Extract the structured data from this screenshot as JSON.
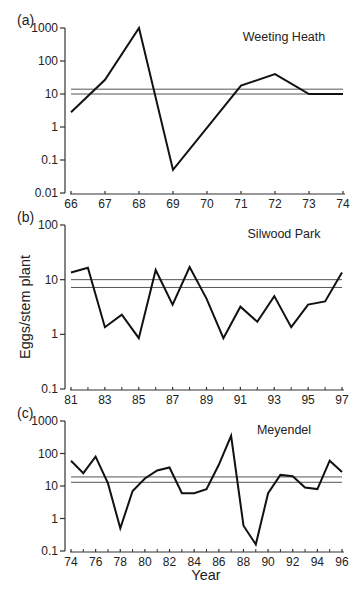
{
  "chart_data": [
    {
      "type": "line",
      "panel_label": "(a)",
      "title": "Weeting Heath",
      "xlabel": "",
      "ylabel": "Eggs/stem plant",
      "yscale": "log",
      "ylim": [
        0.01,
        1000
      ],
      "yticks": [
        "0.01",
        "0.1",
        "1",
        "10",
        "100",
        "1000"
      ],
      "ytick_values": [
        0.01,
        0.1,
        1,
        10,
        100,
        1000
      ],
      "xlim": [
        66,
        74
      ],
      "xticks": [
        "66",
        "67",
        "68",
        "69",
        "70",
        "71",
        "72",
        "73",
        "74"
      ],
      "xtick_values": [
        66,
        67,
        68,
        69,
        70,
        71,
        72,
        73,
        74
      ],
      "minor_xticks": [],
      "x": [
        66,
        67,
        68,
        69,
        71,
        72,
        73,
        74
      ],
      "values": [
        2.8,
        27,
        1000,
        0.05,
        18,
        40,
        10,
        10
      ],
      "reference_lines": [
        14,
        10
      ],
      "grid": false,
      "layout": {
        "top": 28,
        "bottom": 193,
        "left": 71,
        "right": 343,
        "axis_x": 65
      }
    },
    {
      "type": "line",
      "panel_label": "(b)",
      "title": "Silwood Park",
      "xlabel": "",
      "ylabel": "Eggs/stem plant",
      "yscale": "log",
      "ylim": [
        0.1,
        100
      ],
      "yticks": [
        "0.1",
        "1",
        "10",
        "100"
      ],
      "ytick_values": [
        0.1,
        1,
        10,
        100
      ],
      "xlim": [
        81,
        97
      ],
      "xticks": [
        "81",
        "83",
        "85",
        "87",
        "89",
        "91",
        "93",
        "95",
        "97"
      ],
      "xtick_values": [
        81,
        83,
        85,
        87,
        89,
        91,
        93,
        95,
        97
      ],
      "minor_xticks": [
        82,
        84,
        86,
        88,
        90,
        92,
        94,
        96
      ],
      "x": [
        81,
        82,
        83,
        84,
        85,
        86,
        87,
        88,
        89,
        90,
        91,
        92,
        93,
        94,
        95,
        96,
        97
      ],
      "values": [
        13.5,
        16.5,
        1.35,
        2.3,
        0.85,
        15,
        3.5,
        17,
        4.5,
        0.85,
        3.2,
        1.7,
        5,
        1.35,
        3.5,
        4,
        13.5
      ],
      "reference_lines": [
        10,
        7.2
      ],
      "grid": false,
      "layout": {
        "top": 225,
        "bottom": 389,
        "left": 71,
        "right": 342,
        "axis_x": 65
      }
    },
    {
      "type": "line",
      "panel_label": "(c)",
      "title": "Meyendel",
      "xlabel": "Year",
      "ylabel": "Eggs/stem plant",
      "yscale": "log",
      "ylim": [
        0.1,
        1000
      ],
      "yticks": [
        "0.1",
        "1",
        "10",
        "100",
        "1000"
      ],
      "ytick_values": [
        0.1,
        1,
        10,
        100,
        1000
      ],
      "xlim": [
        74,
        96
      ],
      "xticks": [
        "74",
        "76",
        "78",
        "80",
        "82",
        "84",
        "86",
        "88",
        "90",
        "92",
        "94",
        "96"
      ],
      "xtick_values": [
        74,
        76,
        78,
        80,
        82,
        84,
        86,
        88,
        90,
        92,
        94,
        96
      ],
      "minor_xticks": [
        75,
        77,
        79,
        81,
        83,
        85,
        87,
        89,
        91,
        93,
        95
      ],
      "x": [
        74,
        75,
        76,
        77,
        78,
        79,
        80,
        81,
        82,
        83,
        84,
        85,
        86,
        87,
        88,
        89,
        90,
        91,
        92,
        93,
        94,
        95,
        96
      ],
      "values": [
        60,
        25,
        80,
        12,
        0.5,
        7,
        17,
        30,
        37,
        6,
        6,
        8,
        45,
        350,
        0.6,
        0.16,
        6,
        22,
        20,
        9,
        8,
        60,
        27
      ],
      "reference_lines": [
        19,
        13
      ],
      "grid": false,
      "layout": {
        "top": 421,
        "bottom": 551,
        "left": 71,
        "right": 342,
        "axis_x": 65
      }
    }
  ],
  "figure": {
    "shared_ylabel": "Eggs/stem plant",
    "shared_xlabel": "Year",
    "line_color": "#111111",
    "reference_line_color": "#555555",
    "axis_color": "#333333"
  }
}
